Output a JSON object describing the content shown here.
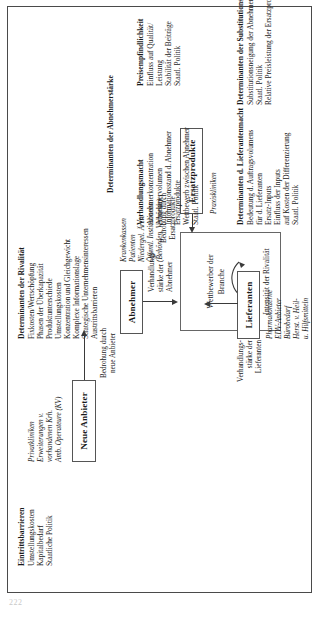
{
  "page": {
    "number": "222",
    "orientation": "rotated-90-ccw"
  },
  "diagram": {
    "center": {
      "line1": "Wettbewerber der",
      "line2": "Branche",
      "caption": "Intensität der Rivalität",
      "arc_icon": "curved-rivalry-arrow"
    },
    "nodes": {
      "new_entrants": {
        "label": "Neue Anbieter",
        "examples": [
          "Privatkliniken",
          "Erweiterungen v.",
          "vorhandenen Krh.",
          "Amb. Operateure (KV)"
        ],
        "arrow_label_l1": "Bedrohung durch",
        "arrow_label_l2": "neue Anbieter"
      },
      "suppliers": {
        "label": "Lieferanten",
        "examples": [
          "Pharmakonzerne",
          "EDV-Anbieter",
          "Bürobedarf",
          "Herst. v. Heil-",
          "u. Hilfsmitteln"
        ],
        "arrow_label_l1": "Verhandlungs-",
        "arrow_label_l2": "stärke der",
        "arrow_label_l3": "Lieferanten"
      },
      "buyers": {
        "label": "Abnehmer",
        "examples": [
          "Krankenkassen",
          "Patienten",
          "Niedergel. Ärzte",
          "Öffentl. Institutionen",
          "(Behörden, Verbände)"
        ],
        "arrow_label_l1": "Verhandlungs-",
        "arrow_label_l2": "stärke der",
        "arrow_label_l3": "Abnehmer"
      },
      "substitutes": {
        "label": "Ersatzprodukte",
        "examples": [
          "Praxiskliniken"
        ],
        "arrow_label_l1": "Bedrohung durch",
        "arrow_label_l2": "Ersatzprodukte"
      }
    },
    "panels": {
      "entry_barriers": {
        "heading": "Eintrittsbarrieren",
        "items": [
          "Umstellungskosten",
          "Kapitalbedarf",
          "Staatliche Politik"
        ]
      },
      "rivalry": {
        "heading": "Determinanten der Rivalität",
        "items": [
          "Fixkosten/Wertschöpfung",
          "Phasen der Überkapazität",
          "Produktunterschiede",
          "Umstellungskosten",
          "Konzentration und Gleichgewicht",
          "Komplexe Informationslage",
          "Strategische Unternehmensinteressen",
          "Austrittsbarrieren"
        ]
      },
      "supplier_power": {
        "heading": "Determinanten d. Lieferantenmacht",
        "items": [
          "Bedeutung d. Auftragsvolumens",
          "für d. Lieferanten",
          "Ersatz-Inputs",
          "Einfluss der Inputs",
          "auf Kosten der Differenzierung",
          "Staatl. Politik"
        ]
      },
      "substitution_threat": {
        "heading": "Determinanten der Substitutionsgefahr",
        "items": [
          "Substitutionsneigung der Abnehmer",
          "Staatl. Politik",
          "Relative Preisleistung der Ersatzprodukte"
        ]
      },
      "buyer_power": {
        "heading": "Determinanten der Abnehmerstärke",
        "sub_left": {
          "heading": "Verhandlungsmacht",
          "items": [
            "Abnehmerkonzentration",
            "Abnehmervolumen",
            "Informationsstand d. Abnehmer",
            "Ersatzprodukte",
            "Wettbewerb zwischen Abnehmer",
            "Staatl. Politik"
          ]
        },
        "sub_right": {
          "heading": "Preisempfindlichkeit",
          "items": [
            "Einfluss auf Qualität/",
            "Leistung",
            "Stabilität der Beiträge",
            "Staatl. Politik"
          ]
        }
      }
    }
  }
}
